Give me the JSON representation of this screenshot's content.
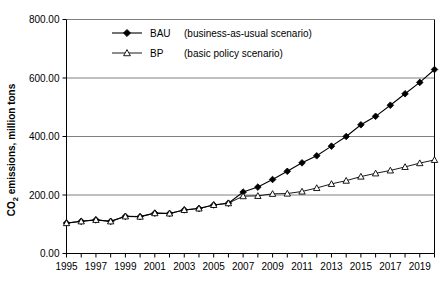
{
  "chart_data": {
    "type": "line",
    "title": "",
    "xlabel": "",
    "ylabel": "CO₂ emissions, million tons",
    "ylabel_main": "emissions, million tons",
    "ylabel_prefix": "CO",
    "ylabel_sub": "2",
    "x": [
      1995,
      1996,
      1997,
      1998,
      1999,
      2000,
      2001,
      2002,
      2003,
      2004,
      2005,
      2006,
      2007,
      2008,
      2009,
      2010,
      2011,
      2012,
      2013,
      2014,
      2015,
      2016,
      2017,
      2018,
      2019,
      2020
    ],
    "xtick_labels": [
      "1995",
      "1997",
      "1999",
      "2001",
      "2003",
      "2005",
      "2007",
      "2009",
      "2011",
      "2013",
      "2015",
      "2017",
      "2019"
    ],
    "xtick_values": [
      1995,
      1997,
      1999,
      2001,
      2003,
      2005,
      2007,
      2009,
      2011,
      2013,
      2015,
      2017,
      2019
    ],
    "ytick_labels": [
      "0.00",
      "200.00",
      "400.00",
      "600.00",
      "800.00"
    ],
    "ytick_values": [
      0,
      200,
      400,
      600,
      800
    ],
    "xlim": [
      1995,
      2020
    ],
    "ylim": [
      0,
      800
    ],
    "grid": "horizontal",
    "legend_position": "top-center",
    "series": [
      {
        "name": "BAU",
        "legend_label": "BAU",
        "legend_note": "(business-as-usual scenario)",
        "marker": "filled-diamond",
        "color": "#000000",
        "values": [
          104,
          110,
          115,
          110,
          127,
          126,
          138,
          137,
          149,
          154,
          166,
          172,
          210,
          227,
          253,
          281,
          310,
          334,
          367,
          400,
          440,
          469,
          507,
          546,
          585,
          629
        ]
      },
      {
        "name": "BP",
        "legend_label": "BP",
        "legend_note": "(basic policy scenario)",
        "marker": "open-triangle",
        "color": "#000000",
        "values": [
          104,
          110,
          115,
          110,
          127,
          126,
          138,
          137,
          149,
          154,
          166,
          172,
          196,
          197,
          204,
          205,
          212,
          224,
          238,
          249,
          263,
          274,
          284,
          296,
          309,
          320
        ]
      }
    ]
  }
}
